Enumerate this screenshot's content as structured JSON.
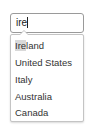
{
  "search": {
    "value": "ire",
    "placeholder": ""
  },
  "suggestions": {
    "items": [
      {
        "match": "Ire",
        "rest": "land",
        "label": "Ireland",
        "highlighted": true
      },
      {
        "match": "",
        "rest": "United States",
        "label": "United States",
        "highlighted": false
      },
      {
        "match": "",
        "rest": "Italy",
        "label": "Italy",
        "highlighted": false
      },
      {
        "match": "",
        "rest": "Australia",
        "label": "Australia",
        "highlighted": false
      },
      {
        "match": "",
        "rest": "Canada",
        "label": "Canada",
        "highlighted": false
      }
    ]
  },
  "colors": {
    "highlight": "#d9d9d9",
    "border": "#9a9a9a",
    "text": "#333333"
  }
}
